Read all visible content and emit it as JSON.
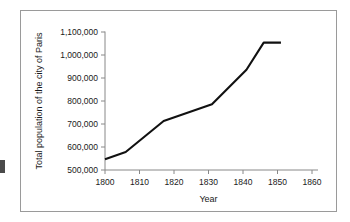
{
  "figure": {
    "background_color": "#ffffff",
    "border_color": "#9a9a9a",
    "line_color": "#111111",
    "axis_color": "#888888",
    "text_color": "#1a1a1a"
  },
  "chart_data": {
    "type": "line",
    "title": "",
    "xlabel": "Year",
    "ylabel": "Total population of the city of Paris",
    "xlim": [
      1795,
      1862
    ],
    "ylim": [
      500000,
      1130000
    ],
    "xticks": [
      1800,
      1810,
      1820,
      1830,
      1840,
      1850,
      1860
    ],
    "xtick_labels": [
      "1800",
      "1810",
      "1820",
      "1830",
      "1840",
      "1850",
      "1860"
    ],
    "yticks": [
      500000,
      600000,
      700000,
      800000,
      900000,
      1000000,
      1100000
    ],
    "ytick_labels": [
      "500,000",
      "600,000",
      "700,000",
      "800,000",
      "900,000",
      "1,000,000",
      "1,100,000"
    ],
    "grid": false,
    "legend": false,
    "series": [
      {
        "name": "Total population of the city of Paris",
        "x": [
          1800,
          1806,
          1817,
          1831,
          1841,
          1846,
          1851
        ],
        "values": [
          547000,
          578000,
          713000,
          786000,
          936000,
          1054000,
          1054000
        ]
      }
    ]
  }
}
